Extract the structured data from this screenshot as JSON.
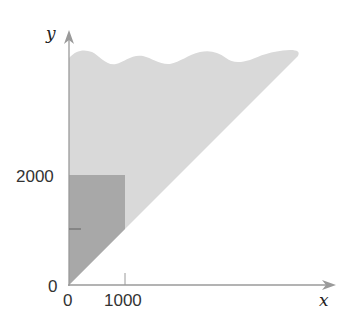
{
  "diagram": {
    "type": "region-plot",
    "axes": {
      "x_label": "x",
      "y_label": "y",
      "x_ticks": [
        "0",
        "1000"
      ],
      "y_ticks": [
        "0",
        "2000"
      ],
      "y_minor_tick_value": 1000
    },
    "regions": [
      {
        "name": "region-above-diagonal",
        "color": "#d9d9d9",
        "bounds": "y >= x, x >= 0, unbounded above (wavy edge)"
      },
      {
        "name": "highlighted-rectangle",
        "color": "#a6a6a6",
        "bounds": "0 <= x <= 1000, x <= y <= 2000"
      }
    ],
    "colors": {
      "axis": "#9a9a9a",
      "light_region": "#d9d9d9",
      "dark_region": "#a6a6a6",
      "tick": "#777777"
    }
  }
}
